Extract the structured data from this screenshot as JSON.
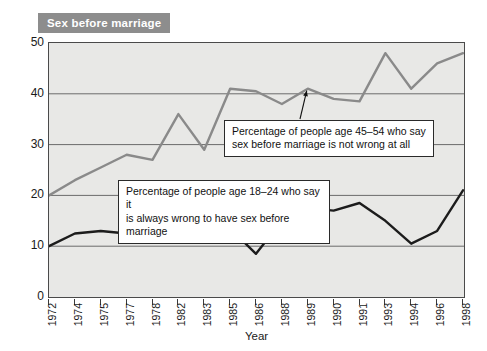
{
  "title": "Sex before marriage",
  "axis_label_x": "Year",
  "colors": {
    "title_banner_bg": "#8d8d8d",
    "title_banner_text": "#ffffff",
    "plot_bg": "#e8e8e6",
    "frame": "#4a4a4a",
    "gridline": "#6b6b6b",
    "series_older": "#8a8a8a",
    "series_younger": "#1c1c1c",
    "callout_bg": "#ffffff",
    "callout_border": "#2a2a2a"
  },
  "annotations": [
    {
      "name": "callout-older",
      "text": "Percentage of people age 45–54 who say\nsex before marriage is not wrong at all"
    },
    {
      "name": "callout-younger",
      "text": "Percentage of people age 18–24 who say it\nis always wrong to have sex before marriage"
    }
  ],
  "chart_data": {
    "type": "line",
    "title": "Sex before marriage",
    "xlabel": "Year",
    "ylabel": "",
    "ylim": [
      0,
      50
    ],
    "yticks": [
      0,
      10,
      20,
      30,
      40,
      50
    ],
    "grid": true,
    "legend": "annotations",
    "categories": [
      "1972",
      "1974",
      "1975",
      "1977",
      "1978",
      "1982",
      "1983",
      "1985",
      "1986",
      "1988",
      "1989",
      "1990",
      "1991",
      "1993",
      "1994",
      "1996",
      "1998"
    ],
    "series": [
      {
        "name": "Percentage of people age 45–54 who say sex before marriage is not wrong at all",
        "color": "#8a8a8a",
        "values": [
          20,
          23,
          25.5,
          28,
          27,
          36,
          29,
          41,
          40.5,
          38,
          41,
          39,
          38.5,
          48,
          41,
          46,
          48
        ]
      },
      {
        "name": "Percentage of people age 18–24 who say it is always wrong to have sex before marriage",
        "color": "#1c1c1c",
        "values": [
          10,
          12.5,
          13,
          12.5,
          12,
          11.5,
          15,
          13.5,
          8.5,
          15,
          17.5,
          17,
          18.5,
          15,
          10.5,
          13,
          21
        ]
      }
    ]
  }
}
